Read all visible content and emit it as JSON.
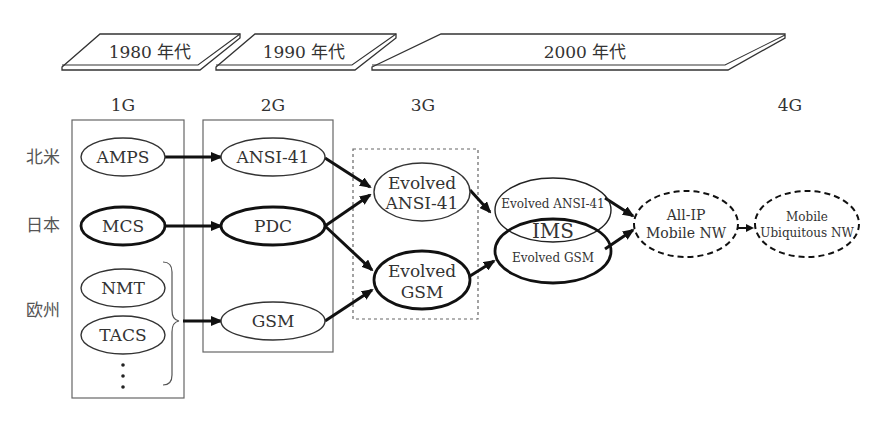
{
  "eras": [
    {
      "label": "1980 年代"
    },
    {
      "label": "1990 年代"
    },
    {
      "label": "2000 年代"
    }
  ],
  "generations": [
    {
      "label": "1G"
    },
    {
      "label": "2G"
    },
    {
      "label": "3G"
    },
    {
      "label": "4G"
    }
  ],
  "regions": [
    {
      "label": "北米"
    },
    {
      "label": "日本"
    },
    {
      "label": "欧州"
    }
  ],
  "nodes": {
    "amps": {
      "label": "AMPS"
    },
    "mcs": {
      "label": "MCS"
    },
    "nmt": {
      "label": "NMT"
    },
    "tacs": {
      "label": "TACS"
    },
    "ellipsis": {
      "label": "⋮"
    },
    "ansi41": {
      "label": "ANSI-41"
    },
    "pdc": {
      "label": "PDC"
    },
    "gsm": {
      "label": "GSM"
    },
    "evolved_ansi41": {
      "line1": "Evolved",
      "line2": "ANSI-41"
    },
    "evolved_gsm": {
      "line1": "Evolved",
      "line2": "GSM"
    },
    "ims": {
      "top": "Evolved ANSI-41",
      "center": "IMS",
      "bottom": "Evolved GSM"
    },
    "all_ip": {
      "line1": "All-IP",
      "line2": "Mobile NW"
    },
    "ubiquitous": {
      "line1": "Mobile",
      "line2": "Ubiquitous NW"
    }
  }
}
